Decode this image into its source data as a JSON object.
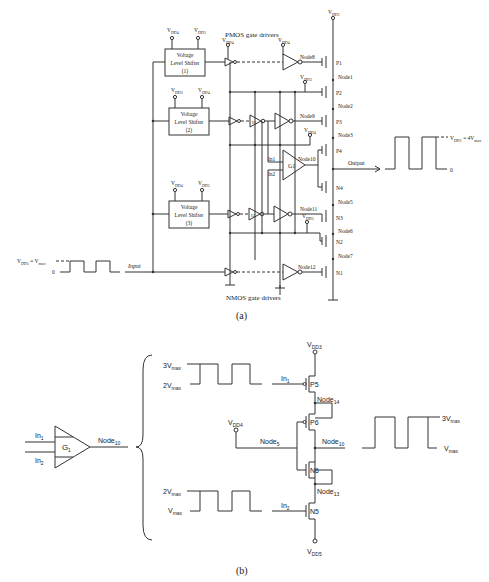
{
  "figure": {
    "part_a": {
      "caption": "(a)",
      "pmos_header": "PMOS gate drivers",
      "nmos_header": "NMOS gate drivers",
      "input_label": "Input",
      "input_wave": {
        "high": "V",
        "high_sub": "DD5",
        "high_eq": " = V",
        "high_eq_sub": "max",
        "low": "0"
      },
      "output_label": "Output",
      "output_wave": {
        "high": "V",
        "high_sub": "DD1",
        "high_eq": " = 4V",
        "high_eq_sub": "max",
        "low": "0"
      },
      "level_shifters": [
        {
          "line1": "Voltage",
          "line2": "Level Shifter",
          "line3": "(1)",
          "supply_left": "DD4",
          "supply_right": "DD3"
        },
        {
          "line1": "Voltage",
          "line2": "Level Shifter",
          "line3": "(2)",
          "supply_left": "DD3",
          "supply_right": "DD4"
        },
        {
          "line1": "Voltage",
          "line2": "Level Shifter",
          "line3": "(3)",
          "supply_left": "DD4",
          "supply_right": "DD5"
        }
      ],
      "supplies": {
        "v": "V",
        "dd1": "DD1",
        "dd3": "DD3",
        "dd4": "DD4",
        "dd5": "DD5"
      },
      "nodes": [
        "Node1",
        "Node2",
        "Node3",
        "Node5",
        "Node6",
        "Node7",
        "Node8",
        "Node9",
        "Node10",
        "Node11",
        "Node12"
      ],
      "transistors": [
        "P1",
        "P2",
        "P3",
        "P4",
        "N4",
        "N3",
        "N2",
        "N1"
      ],
      "gates": {
        "g1": "G1",
        "i1": "I1",
        "i2": "I2",
        "in1": "In1",
        "in2": "In2"
      }
    },
    "part_b": {
      "caption": "(b)",
      "gate": {
        "label": "G",
        "label_sub": "1",
        "in1": "In",
        "in1_sub": "1",
        "in2": "In",
        "in2_sub": "2",
        "out": "Node",
        "out_sub": "10"
      },
      "wave_in1": {
        "high": "3V",
        "high_sub": "max",
        "low": "2V",
        "low_sub": "max",
        "label": "In",
        "label_sub": "1"
      },
      "wave_in2": {
        "high": "2V",
        "high_sub": "max",
        "low": "V",
        "low_sub": "max",
        "label": "In",
        "label_sub": "2"
      },
      "wave_out": {
        "high": "3V",
        "high_sub": "max",
        "low": "V",
        "low_sub": "max"
      },
      "supply_top": {
        "v": "V",
        "sub": "DD3"
      },
      "supply_mid": {
        "v": "V",
        "sub": "DD4"
      },
      "supply_bot": {
        "v": "V",
        "sub": "DD5"
      },
      "transistors": [
        "P5",
        "P6",
        "N6",
        "N5"
      ],
      "nodes": {
        "n14": "Node",
        "n14_sub": "14",
        "n5": "Node",
        "n5_sub": "5",
        "n10": "Node",
        "n10_sub": "10",
        "n13": "Node",
        "n13_sub": "13"
      }
    }
  }
}
